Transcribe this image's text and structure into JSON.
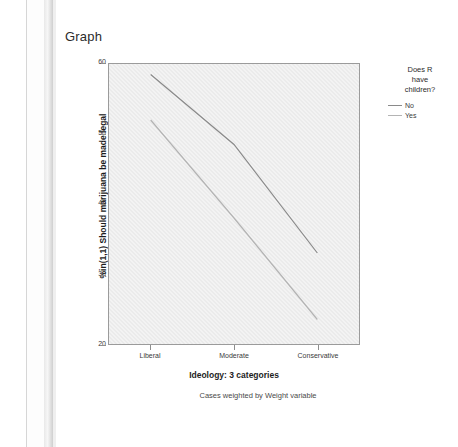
{
  "window": {
    "outline_icons": [
      "output-tree-icon",
      "log-tree-icon",
      "graph-tree-icon"
    ]
  },
  "page_title": "Graph",
  "chart_data": {
    "type": "line",
    "title": "Graph",
    "xlabel": "Ideology: 3 categories",
    "ylabel": "%in(1,1) Should marijuana be made legal",
    "footnote": "Cases weighted by Weight variable",
    "categories": [
      "Liberal",
      "Moderate",
      "Conservative"
    ],
    "ylim": [
      20,
      60
    ],
    "yticks": [
      20,
      30,
      40,
      50,
      60
    ],
    "grid": false,
    "legend_position": "right",
    "legend_title": "Does R\nhave\nchildren?",
    "series": [
      {
        "name": "No",
        "values": [
          58.5,
          48.5,
          33.0
        ],
        "color": "#8a8a8a"
      },
      {
        "name": "Yes",
        "values": [
          52.0,
          38.0,
          23.5
        ],
        "color": "#b4b4b4"
      }
    ]
  },
  "colors": {
    "plot_background": "#ebebeb",
    "frame": "#9b9b9b",
    "text": "#2b2b2b",
    "series_no": "#8a8a8a",
    "series_yes": "#b4b4b4"
  }
}
